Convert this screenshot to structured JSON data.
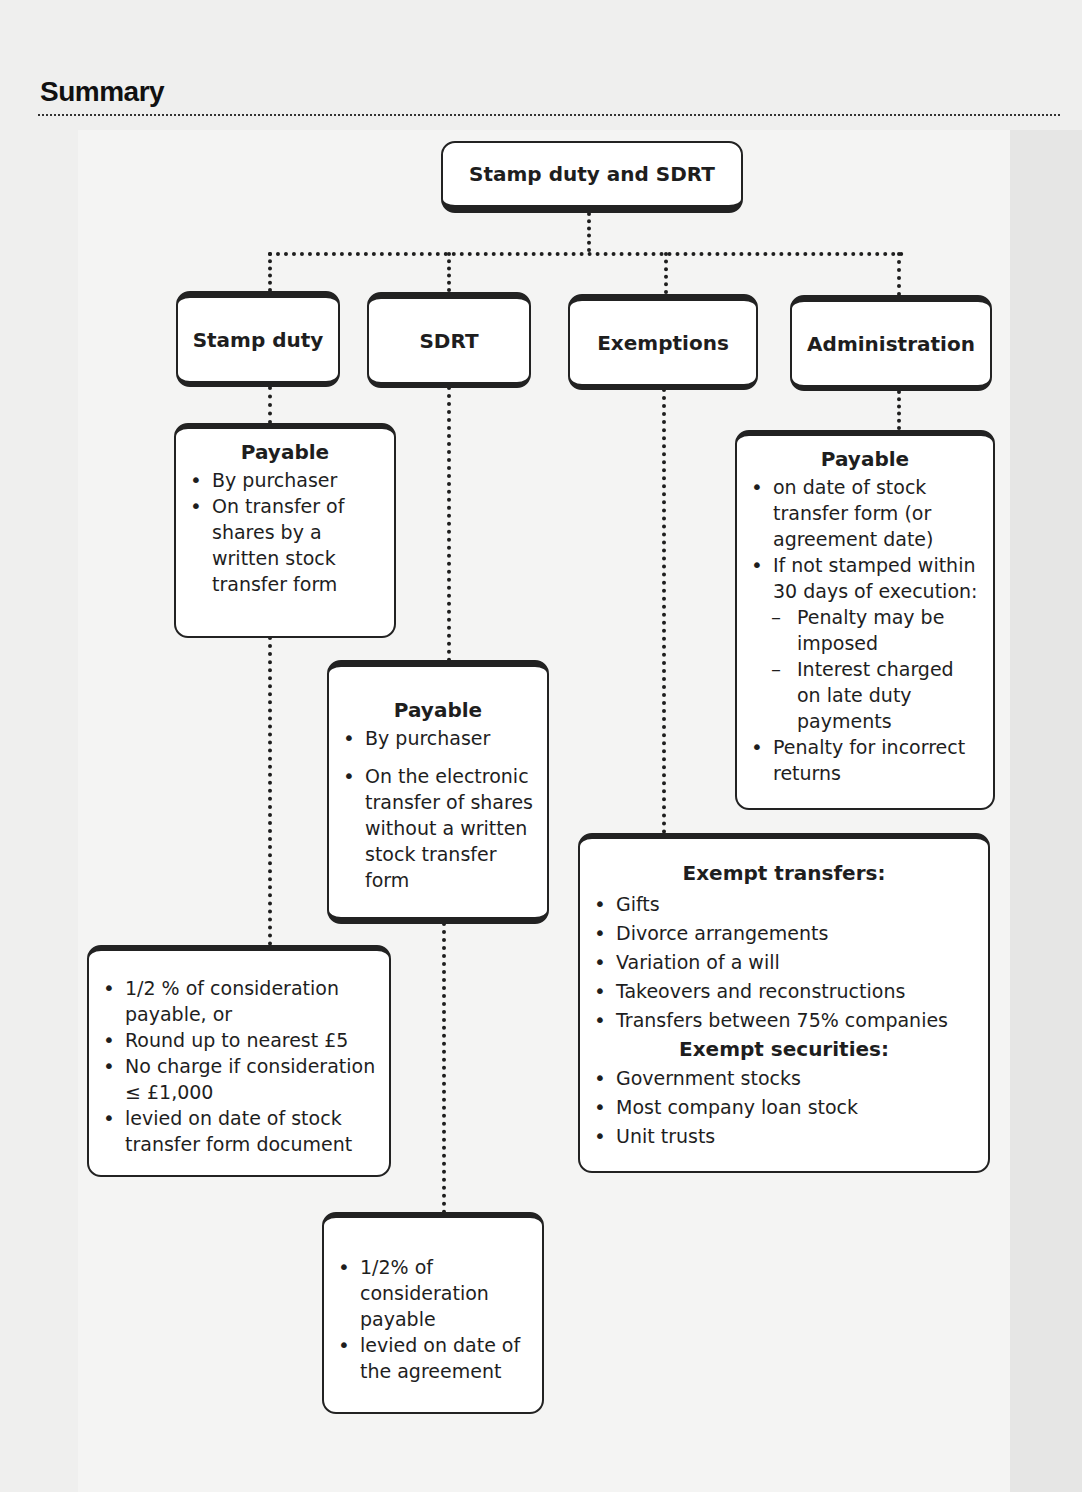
{
  "page": {
    "heading": "Summary"
  },
  "diagram": {
    "root": {
      "label": "Stamp duty and SDRT"
    },
    "branches": [
      {
        "label": "Stamp duty"
      },
      {
        "label": "SDRT"
      },
      {
        "label": "Exemptions"
      },
      {
        "label": "Administration"
      }
    ],
    "stamp_duty_payable": {
      "title": "Payable",
      "items": [
        "By purchaser",
        "On transfer of shares by a written stock transfer form"
      ]
    },
    "stamp_duty_rate": {
      "items": [
        "1/2 % of consideration payable, or",
        "Round up to nearest £5",
        "No charge if consideration ≤ £1,000",
        "levied on date of stock transfer form document"
      ]
    },
    "sdrt_payable": {
      "title": "Payable",
      "items": [
        "By purchaser",
        "On the electronic transfer of shares without a written stock transfer form"
      ]
    },
    "sdrt_rate": {
      "items": [
        "1/2% of consideration payable",
        "levied on date of the agreement"
      ]
    },
    "exemptions": {
      "transfers_title": "Exempt transfers:",
      "transfers": [
        "Gifts",
        "Divorce arrangements",
        "Variation of a will",
        "Takeovers and reconstructions",
        "Transfers between 75% companies"
      ],
      "securities_title": "Exempt securities:",
      "securities": [
        "Government stocks",
        "Most company loan stock",
        "Unit trusts"
      ]
    },
    "administration_payable": {
      "title": "Payable",
      "items": [
        "on date of stock transfer form (or agreement date)",
        "If not stamped within 30 days of execution:"
      ],
      "subitems": [
        "Penalty may be imposed",
        "Interest charged on late duty payments"
      ],
      "final_item": "Penalty for incorrect returns"
    }
  }
}
